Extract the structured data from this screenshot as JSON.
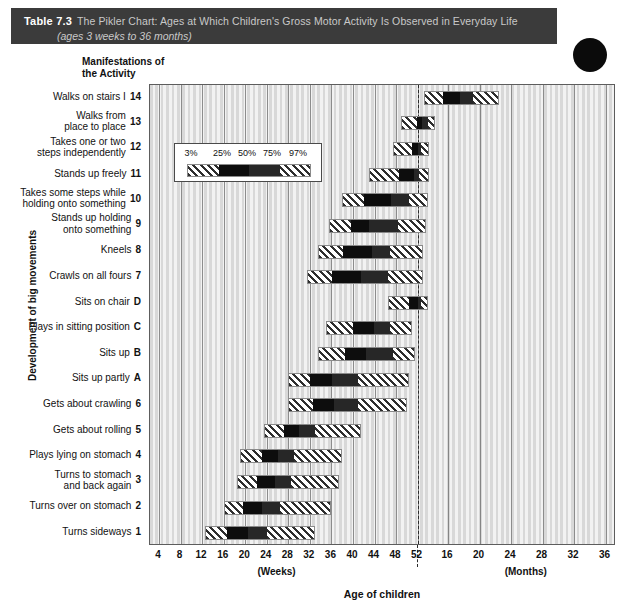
{
  "banner": {
    "table_label": "Table 7.3",
    "title": "The Pikler Chart: Ages at Which Children's Gross Motor Activity Is Observed in Everyday Life",
    "subtitle": "(ages 3 weeks to 36 months)",
    "background_color": "#3b3b3b",
    "title_color": "#c9c9c9"
  },
  "column_header": "Manifestations of\nthe Activity",
  "yaxis_title": "Development of big movements",
  "xaxis_title": "Age of children",
  "unit_labels": {
    "weeks": "(Weeks)",
    "months": "(Months)"
  },
  "legend": {
    "percent_labels": [
      "3%",
      "25%",
      "50%",
      "75%",
      "97%"
    ],
    "segments": [
      "hatch",
      "black",
      "dark",
      "hatch"
    ]
  },
  "chart_data": {
    "type": "bar",
    "title": "The Pikler Chart: Ages at Which Children's Gross Motor Activity Is Observed in Everyday Life",
    "subtitle": "(ages 3 weeks to 36 months)",
    "xlabel": "Age of children",
    "ylabel": "Development of big movements",
    "grid": true,
    "legend_position": "inside-upper-left",
    "percentiles": [
      3,
      25,
      50,
      75,
      97
    ],
    "x_ticks_weeks": [
      4,
      8,
      12,
      16,
      20,
      24,
      28,
      32,
      36,
      40,
      44,
      48,
      52
    ],
    "x_ticks_months": [
      16,
      20,
      24,
      28,
      32,
      36
    ],
    "week_axis_range": [
      0,
      52
    ],
    "month_axis_range": [
      12,
      36
    ],
    "year_divider_at": "52 weeks / 12 months",
    "categories": [
      "Walks on stairs I",
      "Walks from place to place",
      "Takes one or two steps independently",
      "Stands up freely",
      "Takes some steps while holding onto something",
      "Stands up holding onto something",
      "Kneels",
      "Crawls on all fours",
      "Sits on chair",
      "Plays in sitting position",
      "Sits up",
      "Sits up partly",
      "Gets about crawling",
      "Gets about rolling",
      "Plays lying on stomach",
      "Turns to stomach and back again",
      "Turns over on stomach",
      "Turns sideways"
    ],
    "codes": [
      "14",
      "13",
      "12",
      "11",
      "10",
      "9",
      "8",
      "7",
      "D",
      "C",
      "B",
      "A",
      "6",
      "5",
      "4",
      "3",
      "2",
      "1"
    ],
    "rows": [
      {
        "code": "14",
        "label": "Walks on stairs I",
        "unit": "months",
        "p3": 13.0,
        "p25": 15.3,
        "p50": 17.5,
        "p75": 19.2,
        "p97": 22.5
      },
      {
        "code": "13",
        "label": "Walks from place to place",
        "unit": "mixed",
        "p3": 49.0,
        "p25": 52.5,
        "p50": 55.5,
        "p75": 59.0,
        "p97": 62.0
      },
      {
        "code": "12",
        "label": "Takes one or two steps independently",
        "unit": "mixed",
        "p3": 47.5,
        "p25": 51.0,
        "p50": 53.0,
        "p75": 55.0,
        "p97": 59.0
      },
      {
        "code": "11",
        "label": "Stands up freely",
        "unit": "mixed",
        "p3": 43.0,
        "p25": 48.5,
        "p50": 51.5,
        "p75": 53.5,
        "p97": 59.0
      },
      {
        "code": "10",
        "label": "Takes some steps while holding onto something",
        "unit": "weeks",
        "p3": 38.0,
        "p25": 42.0,
        "p50": 47.0,
        "p75": 50.5,
        "p97": 54.0
      },
      {
        "code": "9",
        "label": "Stands up holding onto something",
        "unit": "weeks",
        "p3": 35.5,
        "p25": 39.5,
        "p50": 43.0,
        "p75": 48.5,
        "p97": 53.5
      },
      {
        "code": "8",
        "label": "Kneels",
        "unit": "weeks",
        "p3": 33.5,
        "p25": 38.0,
        "p50": 43.5,
        "p75": 47.0,
        "p97": 53.0
      },
      {
        "code": "7",
        "label": "Crawls on all fours",
        "unit": "weeks",
        "p3": 31.5,
        "p25": 36.0,
        "p50": 41.5,
        "p75": 46.5,
        "p97": 53.0
      },
      {
        "code": "D",
        "label": "Sits on chair",
        "unit": "mixed",
        "p3": 46.5,
        "p25": 50.5,
        "p50": 53.0,
        "p75": 55.0,
        "p97": 58.5
      },
      {
        "code": "C",
        "label": "Plays in sitting position",
        "unit": "weeks",
        "p3": 35.0,
        "p25": 40.0,
        "p50": 44.0,
        "p75": 47.0,
        "p97": 51.0
      },
      {
        "code": "B",
        "label": "Sits up",
        "unit": "weeks",
        "p3": 33.5,
        "p25": 38.5,
        "p50": 42.5,
        "p75": 47.5,
        "p97": 51.5
      },
      {
        "code": "A",
        "label": "Sits up partly",
        "unit": "weeks",
        "p3": 28.0,
        "p25": 32.0,
        "p50": 36.0,
        "p75": 41.0,
        "p97": 50.5
      },
      {
        "code": "6",
        "label": "Gets about crawling",
        "unit": "weeks",
        "p3": 28.0,
        "p25": 32.5,
        "p50": 36.5,
        "p75": 41.0,
        "p97": 50.0
      },
      {
        "code": "5",
        "label": "Gets about rolling",
        "unit": "weeks",
        "p3": 23.5,
        "p25": 27.0,
        "p50": 30.0,
        "p75": 33.0,
        "p97": 41.5
      },
      {
        "code": "4",
        "label": "Plays lying on stomach",
        "unit": "weeks",
        "p3": 19.0,
        "p25": 23.0,
        "p50": 26.0,
        "p75": 29.0,
        "p97": 38.0
      },
      {
        "code": "3",
        "label": "Turns to stomach and back again",
        "unit": "weeks",
        "p3": 18.5,
        "p25": 22.0,
        "p50": 25.5,
        "p75": 28.5,
        "p97": 37.5
      },
      {
        "code": "2",
        "label": "Turns over on stomach",
        "unit": "weeks",
        "p3": 16.0,
        "p25": 19.5,
        "p50": 23.0,
        "p75": 26.5,
        "p97": 36.0
      },
      {
        "code": "1",
        "label": "Turns sideways",
        "unit": "weeks",
        "p3": 12.5,
        "p25": 16.5,
        "p50": 20.5,
        "p75": 24.0,
        "p97": 33.0
      }
    ]
  }
}
